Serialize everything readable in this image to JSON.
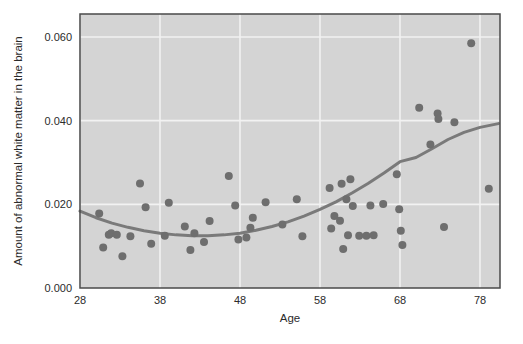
{
  "chart_data": {
    "type": "scatter",
    "title": "",
    "xlabel": "Age",
    "ylabel": "Amount of abnormal white matter in the brain",
    "xlim": [
      28,
      80.5
    ],
    "ylim": [
      0.0,
      0.0655
    ],
    "xticks": [
      28,
      38,
      48,
      58,
      68,
      78
    ],
    "xtick_labels": [
      "28",
      "38",
      "48",
      "58",
      "68",
      "78"
    ],
    "yticks": [
      0.0,
      0.02,
      0.04,
      0.06
    ],
    "ytick_labels": [
      "0.000",
      "0.020",
      "0.040",
      "0.060"
    ],
    "grid": true,
    "grid_color": "#f2f2f2",
    "plot_background": "#d4d4d4",
    "figure_background": "#ffffff",
    "axis_border_color": "#4a4a4a",
    "marker_color": "#6e6e6e",
    "marker_size": 8,
    "legend": "none",
    "series": [
      {
        "name": "Subjects",
        "type": "scatter",
        "points": [
          [
            30.4,
            0.0178
          ],
          [
            30.9,
            0.0097
          ],
          [
            31.6,
            0.0127
          ],
          [
            31.9,
            0.0131
          ],
          [
            32.6,
            0.0127
          ],
          [
            33.3,
            0.0076
          ],
          [
            34.3,
            0.0124
          ],
          [
            35.5,
            0.025
          ],
          [
            36.2,
            0.0193
          ],
          [
            36.9,
            0.0106
          ],
          [
            38.6,
            0.0125
          ],
          [
            39.1,
            0.0204
          ],
          [
            41.1,
            0.0147
          ],
          [
            41.8,
            0.0091
          ],
          [
            42.3,
            0.0131
          ],
          [
            43.5,
            0.011
          ],
          [
            44.2,
            0.016
          ],
          [
            46.6,
            0.0268
          ],
          [
            47.4,
            0.0197
          ],
          [
            47.8,
            0.0116
          ],
          [
            48.8,
            0.0121
          ],
          [
            49.3,
            0.0144
          ],
          [
            49.6,
            0.0168
          ],
          [
            51.2,
            0.0205
          ],
          [
            53.3,
            0.0152
          ],
          [
            55.1,
            0.0212
          ],
          [
            55.8,
            0.0124
          ],
          [
            59.2,
            0.0239
          ],
          [
            59.4,
            0.0142
          ],
          [
            59.8,
            0.0172
          ],
          [
            60.5,
            0.0161
          ],
          [
            60.7,
            0.0249
          ],
          [
            60.9,
            0.0093
          ],
          [
            61.3,
            0.0212
          ],
          [
            61.5,
            0.0126
          ],
          [
            61.8,
            0.026
          ],
          [
            62.1,
            0.0196
          ],
          [
            62.9,
            0.0125
          ],
          [
            63.8,
            0.0125
          ],
          [
            64.3,
            0.0197
          ],
          [
            64.7,
            0.0126
          ],
          [
            65.9,
            0.0201
          ],
          [
            67.6,
            0.0272
          ],
          [
            67.9,
            0.0188
          ],
          [
            68.1,
            0.0137
          ],
          [
            68.3,
            0.0103
          ],
          [
            70.4,
            0.0431
          ],
          [
            71.8,
            0.0343
          ],
          [
            72.7,
            0.0417
          ],
          [
            72.8,
            0.0404
          ],
          [
            73.5,
            0.0146
          ],
          [
            74.8,
            0.0396
          ],
          [
            76.9,
            0.0585
          ],
          [
            79.1,
            0.0237
          ]
        ]
      },
      {
        "name": "Fitted quadratic trend",
        "type": "line",
        "color": "#7a7a7a",
        "line_width": 3,
        "points": [
          [
            28.0,
            0.0184
          ],
          [
            30.0,
            0.0168
          ],
          [
            32.0,
            0.0155
          ],
          [
            34.0,
            0.0145
          ],
          [
            36.0,
            0.0137
          ],
          [
            38.0,
            0.0131
          ],
          [
            40.0,
            0.0127
          ],
          [
            42.0,
            0.0125
          ],
          [
            44.0,
            0.0125
          ],
          [
            46.0,
            0.0127
          ],
          [
            48.0,
            0.0131
          ],
          [
            50.0,
            0.0138
          ],
          [
            52.0,
            0.0147
          ],
          [
            54.0,
            0.0158
          ],
          [
            56.0,
            0.0172
          ],
          [
            58.0,
            0.0188
          ],
          [
            60.0,
            0.0206
          ],
          [
            62.0,
            0.0227
          ],
          [
            64.0,
            0.025
          ],
          [
            66.0,
            0.0275
          ],
          [
            68.0,
            0.0302
          ],
          [
            70.0,
            0.0312
          ],
          [
            72.0,
            0.0333
          ],
          [
            74.0,
            0.0355
          ],
          [
            76.0,
            0.0372
          ],
          [
            78.0,
            0.0384
          ],
          [
            80.3,
            0.0393
          ]
        ]
      }
    ]
  },
  "axes": {
    "x_title": "Age",
    "y_title": "Amount of abnormal white matter in the brain"
  }
}
